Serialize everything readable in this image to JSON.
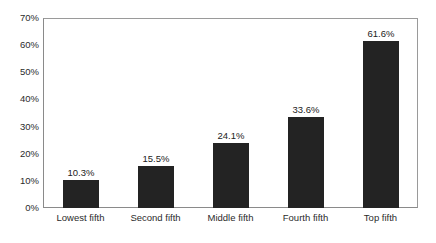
{
  "chart_data": {
    "type": "bar",
    "title": "",
    "xlabel": "",
    "ylabel": "",
    "categories": [
      "Lowest fifth",
      "Second fifth",
      "Middle fifth",
      "Fourth fifth",
      "Top fifth"
    ],
    "values": [
      10.3,
      15.5,
      24.1,
      33.6,
      61.6
    ],
    "data_labels": [
      "10.3%",
      "15.5%",
      "24.1%",
      "33.6%",
      "61.6%"
    ],
    "ylim": [
      0,
      70
    ],
    "y_tick_values": [
      0,
      10,
      20,
      30,
      40,
      50,
      60,
      70
    ],
    "y_tick_labels": [
      "0%",
      "10%",
      "20%",
      "30%",
      "40%",
      "50%",
      "60%",
      "70%"
    ],
    "grid": false,
    "legend": false,
    "legend_position": "none",
    "bar_color": "#232323",
    "plot_border_color": "#8a8a8a",
    "background_color": "#ffffff",
    "text_color": "#2b2b2b"
  }
}
